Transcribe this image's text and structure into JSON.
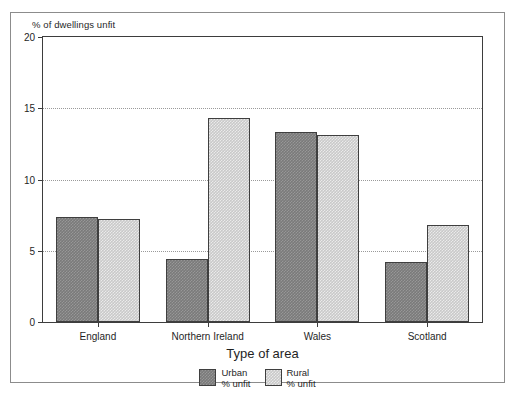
{
  "chart_data": {
    "type": "bar",
    "title": "",
    "ylabel": "% of dwellings unfit",
    "xlabel": "Type of area",
    "categories": [
      "England",
      "Northern Ireland",
      "Wales",
      "Scotland"
    ],
    "series": [
      {
        "name": "Urban\n% unfit",
        "legend_line1": "Urban",
        "legend_line2": "% unfit",
        "key": "urban",
        "color": "#7a7a7a",
        "values": [
          7.4,
          4.4,
          13.3,
          4.2
        ]
      },
      {
        "name": "Rural\n% unfit",
        "legend_line1": "Rural",
        "legend_line2": "% unfit",
        "key": "rural",
        "color": "#c9c9c9",
        "values": [
          7.2,
          14.3,
          13.1,
          6.8
        ]
      }
    ],
    "ylim": [
      0,
      20
    ],
    "yticks": [
      0,
      5,
      10,
      15,
      20
    ],
    "ytick_labels": [
      "0",
      "5",
      "10",
      "15",
      "20"
    ],
    "gridlines_at": [
      5,
      10,
      15
    ],
    "grid": "horizontal-dotted",
    "legend_position": "bottom-center"
  }
}
